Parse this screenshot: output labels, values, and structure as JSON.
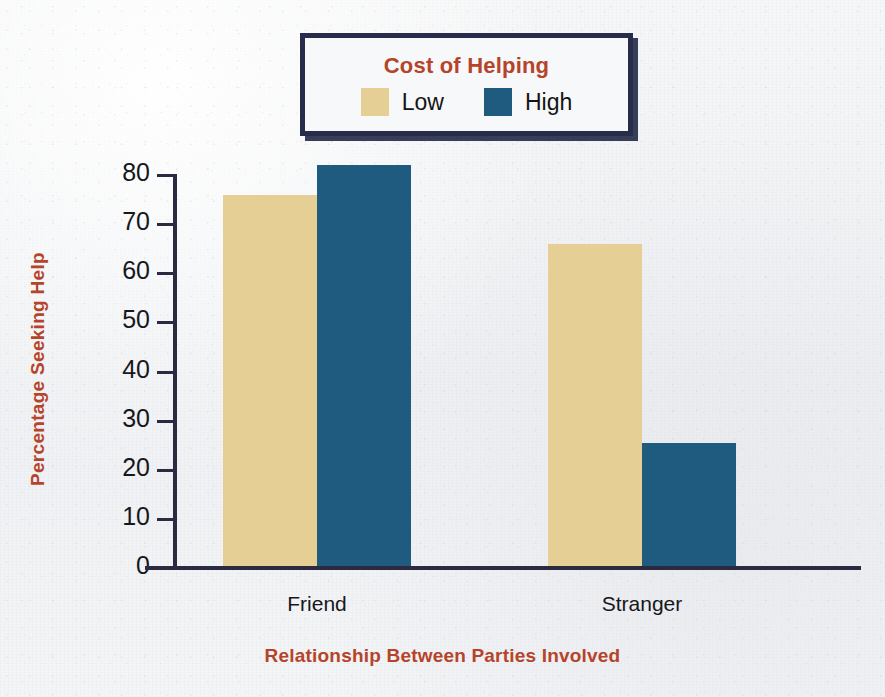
{
  "legend": {
    "title": "Cost of Helping",
    "entries": [
      {
        "label": "Low",
        "color": "#e5cf94",
        "swatch_name": "legend-swatch-low"
      },
      {
        "label": "High",
        "color": "#1e5b7e",
        "swatch_name": "legend-swatch-high"
      }
    ],
    "border_color": "#272c4a",
    "title_color": "#b5442a"
  },
  "chart_data": {
    "type": "bar",
    "title": "Cost of Helping",
    "xlabel": "Relationship Between Parties Involved",
    "ylabel": "Percentage Seeking Help",
    "categories": [
      "Friend",
      "Stranger"
    ],
    "series": [
      {
        "name": "Low",
        "color": "#e5cf94",
        "values": [
          76,
          66
        ]
      },
      {
        "name": "High",
        "color": "#1e5b7e",
        "values": [
          82,
          25.5
        ]
      }
    ],
    "ylim": [
      0,
      80
    ],
    "yticks": [
      0,
      10,
      20,
      30,
      40,
      50,
      60,
      70,
      80
    ],
    "ytick_labels": [
      "0",
      "10",
      "20",
      "30",
      "40",
      "50",
      "60",
      "70",
      "80"
    ],
    "grid": false,
    "legend_position": "top-center",
    "axis_color": "#2b2a40",
    "label_color": "#b5442a"
  }
}
